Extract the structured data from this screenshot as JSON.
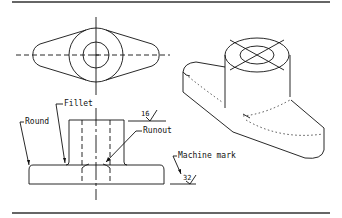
{
  "figure": {
    "type": "technical drawing",
    "views": [
      "top-view",
      "front-view",
      "isometric-view"
    ],
    "colors": {
      "line": "#111111",
      "frame": "#666666",
      "background": "#ffffff"
    }
  },
  "labels": {
    "fillet": "Fillet",
    "round": "Round",
    "runout": "Runout",
    "machine_mark": "Machine mark"
  },
  "surface_finish": {
    "upper": "16",
    "lower": "32"
  }
}
